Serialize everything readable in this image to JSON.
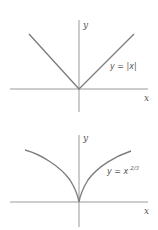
{
  "colors": {
    "axis": "#9a9a9a",
    "curve": "#7d7d7d",
    "text": "#555555",
    "background": "#ffffff"
  },
  "graphs": [
    {
      "id": "abs",
      "y_axis_label": "y",
      "x_axis_label": "x",
      "equation": "y = |x|",
      "equation_sup": ""
    },
    {
      "id": "pow",
      "y_axis_label": "y",
      "x_axis_label": "x",
      "equation": "y = x",
      "equation_sup": "2/3"
    }
  ]
}
